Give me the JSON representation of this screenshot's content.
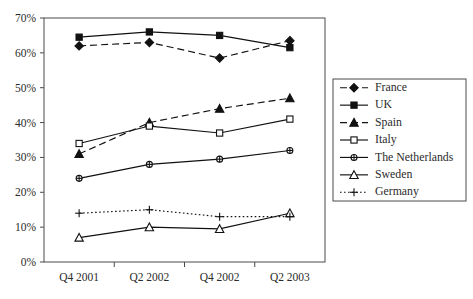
{
  "chart_data": {
    "type": "line",
    "title": "",
    "xlabel": "",
    "ylabel": "",
    "categories": [
      "Q4 2001",
      "Q2 2002",
      "Q4 2002",
      "Q2 2003"
    ],
    "ylim": [
      0,
      70
    ],
    "yticks": [
      0,
      10,
      20,
      30,
      40,
      50,
      60,
      70
    ],
    "ytick_labels": [
      "0%",
      "10%",
      "20%",
      "30%",
      "40%",
      "50%",
      "60%",
      "70%"
    ],
    "grid": false,
    "legend_position": "right",
    "series": [
      {
        "name": "France",
        "values": [
          62,
          63,
          58.5,
          63.5
        ],
        "marker": "diamond-filled",
        "dash": "dashed",
        "color": "#111111"
      },
      {
        "name": "UK",
        "values": [
          64.5,
          66,
          65,
          61.5
        ],
        "marker": "square-filled",
        "dash": "solid",
        "color": "#111111"
      },
      {
        "name": "Spain",
        "values": [
          31,
          40,
          44,
          47
        ],
        "marker": "triangle-filled",
        "dash": "dashed",
        "color": "#111111"
      },
      {
        "name": "Italy",
        "values": [
          34,
          39,
          37,
          41
        ],
        "marker": "square-hollow",
        "dash": "solid",
        "color": "#111111"
      },
      {
        "name": "The Netherlands",
        "values": [
          24,
          28,
          29.5,
          32
        ],
        "marker": "circle-hollow",
        "dash": "solid",
        "color": "#111111"
      },
      {
        "name": "Sweden",
        "values": [
          7,
          10,
          9.5,
          14
        ],
        "marker": "triangle-hollow",
        "dash": "solid",
        "color": "#111111"
      },
      {
        "name": "Germany",
        "values": [
          14,
          15,
          13,
          13
        ],
        "marker": "plus",
        "dash": "dotted",
        "color": "#111111"
      }
    ]
  },
  "legend": {
    "items": [
      {
        "label": "France"
      },
      {
        "label": "UK"
      },
      {
        "label": "Spain"
      },
      {
        "label": "Italy"
      },
      {
        "label": "The Netherlands"
      },
      {
        "label": "Sweden"
      },
      {
        "label": "Germany"
      }
    ]
  }
}
